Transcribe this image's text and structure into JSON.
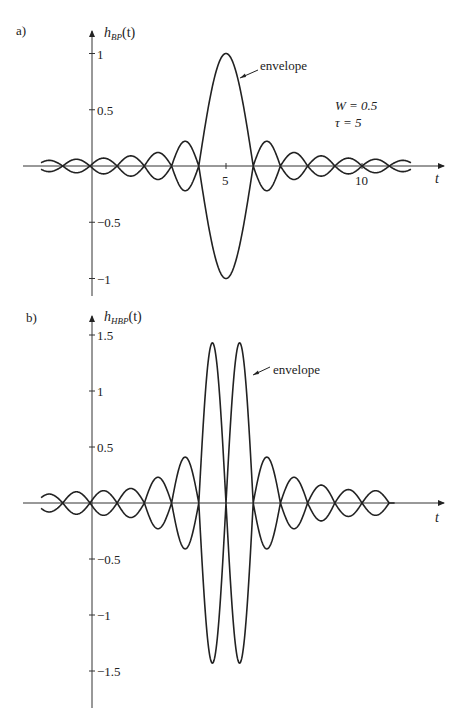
{
  "chart_data": [
    {
      "type": "line",
      "panel_label": "a)",
      "ylabel": "h_BP(t)",
      "ylabel_main": "h",
      "ylabel_sub": "BP",
      "ylabel_arg": "(t)",
      "xlabel": "t",
      "annotation": "envelope",
      "params": [
        "W = 0.5",
        "τ = 5"
      ],
      "yticks": [
        1,
        0.5,
        -0.5,
        -1
      ],
      "ytick_labels": [
        "1",
        "0.5",
        "−0.5",
        "−1"
      ],
      "xticks": [
        5,
        10
      ],
      "xtick_labels": [
        "5",
        "10"
      ],
      "xlim": [
        -1.8,
        13.3
      ],
      "ylim": [
        -1.1,
        1.1
      ],
      "grid": false,
      "description": "Bandpass impulse response envelope ±|sinc(t−5)|, nulls at integer t except t=5",
      "envelope_nulls_t": [
        -2,
        -1,
        0,
        1,
        2,
        3,
        4,
        6,
        7,
        8,
        9,
        10,
        11,
        12
      ],
      "envelope_peaks": {
        "t": [
          -1.5,
          -0.5,
          0.5,
          1.5,
          2.5,
          3.5,
          5,
          6.5,
          7.5,
          8.5,
          9.5,
          10.5,
          11.5
        ],
        "values": [
          0.05,
          0.06,
          0.07,
          0.09,
          0.12,
          0.22,
          1.0,
          0.22,
          0.12,
          0.09,
          0.07,
          0.06,
          0.05
        ]
      },
      "series": [
        {
          "name": "upper envelope",
          "sign": 1
        },
        {
          "name": "lower envelope",
          "sign": -1
        }
      ]
    },
    {
      "type": "line",
      "panel_label": "b)",
      "ylabel": "h_HBP(t)",
      "ylabel_main": "h",
      "ylabel_sub": "HBP",
      "ylabel_arg": "(t)",
      "xlabel": "t",
      "annotation": "envelope",
      "yticks": [
        1.5,
        1,
        0.5,
        -0.5,
        -1,
        -1.5
      ],
      "ytick_labels": [
        "1.5",
        "1",
        "0.5",
        "−0.5",
        "−1",
        "−1.5"
      ],
      "xticks": [],
      "xlim": [
        -1.8,
        13.3
      ],
      "ylim": [
        -1.7,
        1.7
      ],
      "grid": false,
      "description": "Hilbert-transformed bandpass envelope, null at t=5, twin peaks ≈ ±1.43",
      "envelope_nulls_t": [
        -2,
        -1,
        0,
        1,
        2,
        3,
        4,
        5,
        6,
        7,
        8,
        9,
        10,
        11
      ],
      "envelope_peaks": {
        "t": [
          -1.5,
          -0.5,
          0.5,
          1.5,
          2.5,
          3.5,
          4.5,
          5.5,
          6.5,
          7.5,
          8.5,
          9.5,
          10.5
        ],
        "values": [
          0.08,
          0.1,
          0.11,
          0.13,
          0.23,
          0.41,
          1.43,
          1.43,
          0.41,
          0.23,
          0.16,
          0.12,
          0.11
        ]
      },
      "series": [
        {
          "name": "upper envelope",
          "sign": 1
        },
        {
          "name": "lower envelope",
          "sign": -1
        }
      ]
    }
  ]
}
